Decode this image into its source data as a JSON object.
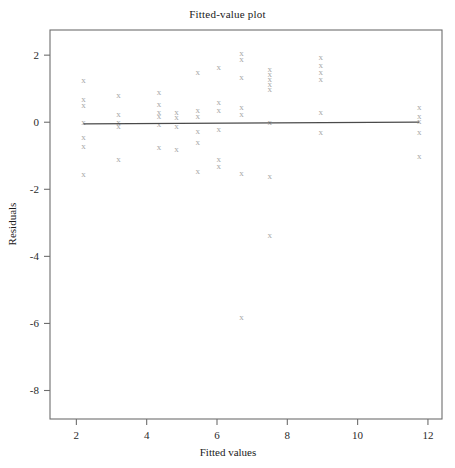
{
  "chart_data": {
    "type": "scatter",
    "title": "Fitted-value plot",
    "xlabel": "Fitted values",
    "ylabel": "Residuals",
    "xlim": [
      1.25,
      12.4
    ],
    "ylim": [
      -8.85,
      2.75
    ],
    "xticks": [
      2,
      4,
      6,
      8,
      10,
      12
    ],
    "yticks": [
      2,
      0,
      -2,
      -4,
      -6,
      -8
    ],
    "xtick_labels": [
      "2",
      "4",
      "6",
      "8",
      "10",
      "12"
    ],
    "ytick_labels": [
      "2",
      "0",
      "-2",
      "-4",
      "-6",
      "-8"
    ],
    "grid": false,
    "legend": null,
    "marker_symbol": "x",
    "marker_color": "#a8a8a8",
    "frame_color": "#6e6e6e",
    "line_color": "#4a4a4a",
    "reference_line": {
      "name": "zero-residual-fit-line",
      "x_start": 2.2,
      "x_end": 11.75,
      "y_start": -0.05,
      "y_end": 0.0
    },
    "x": [
      2.2,
      2.2,
      2.2,
      2.2,
      2.2,
      2.2,
      2.2,
      3.2,
      3.2,
      3.2,
      3.2,
      3.2,
      4.35,
      4.35,
      4.35,
      4.35,
      4.35,
      4.35,
      4.85,
      4.85,
      4.85,
      4.85,
      5.45,
      5.45,
      5.45,
      5.45,
      5.45,
      5.45,
      6.05,
      6.05,
      6.05,
      6.05,
      6.05,
      6.05,
      6.7,
      6.7,
      6.7,
      6.7,
      6.7,
      6.7,
      6.7,
      7.5,
      7.5,
      7.5,
      7.5,
      7.5,
      7.5,
      7.5,
      7.5,
      8.95,
      8.95,
      8.95,
      8.95,
      8.95,
      8.95,
      11.75,
      11.75,
      11.75,
      11.75,
      11.75
    ],
    "y": [
      1.25,
      0.7,
      0.5,
      0.0,
      -0.45,
      -0.7,
      -1.55,
      0.8,
      0.25,
      0.0,
      -0.1,
      -1.1,
      0.9,
      0.55,
      0.3,
      0.2,
      -0.05,
      -0.75,
      0.3,
      0.15,
      -0.1,
      -0.8,
      1.5,
      0.35,
      0.2,
      -0.25,
      -0.6,
      -1.45,
      1.65,
      0.6,
      0.35,
      -0.2,
      -1.1,
      -1.3,
      2.05,
      1.9,
      1.35,
      0.45,
      0.25,
      -1.5,
      -5.8,
      1.6,
      1.45,
      1.3,
      1.15,
      1.0,
      0.0,
      -1.6,
      -3.35,
      1.95,
      1.7,
      1.5,
      1.3,
      0.3,
      -0.3,
      0.45,
      0.2,
      0.05,
      -0.3,
      -1.0
    ]
  }
}
